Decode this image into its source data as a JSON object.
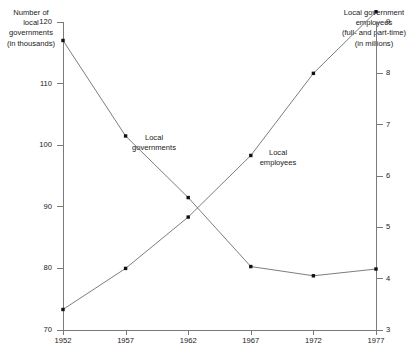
{
  "chart_data": {
    "type": "line",
    "title": "",
    "subtitle": "",
    "xlabel": "",
    "ylabel": "Number of local governments (in thousands)",
    "y2label": "Local government employees (full- and part-time) (in millions)",
    "categories": [
      "1952",
      "1957",
      "1962",
      "1967",
      "1972",
      "1977"
    ],
    "x": [
      1952,
      1957,
      1962,
      1967,
      1972,
      1977
    ],
    "grid": false,
    "legend": "inline-annotations",
    "ylim": [
      70,
      120
    ],
    "y2lim": [
      3,
      9
    ],
    "yticks": [
      "70",
      "80",
      "90",
      "100",
      "110",
      "120"
    ],
    "y2ticks": [
      "3",
      "4",
      "5",
      "6",
      "7",
      "8",
      "9"
    ],
    "series": [
      {
        "name": "Local governments",
        "axis": "left",
        "units": "thousands",
        "values": [
          117.0,
          101.5,
          91.5,
          80.3,
          78.8,
          79.9
        ]
      },
      {
        "name": "Local employees",
        "axis": "right",
        "units": "millions",
        "values": [
          3.4,
          4.2,
          5.2,
          6.4,
          8.0,
          9.2
        ]
      }
    ],
    "annotations": [
      {
        "text": "Local\ngovernments",
        "series": "Local governments"
      },
      {
        "text": "Local\nemployees",
        "series": "Local employees"
      }
    ]
  },
  "axes": {
    "left_caption": "Number of\nlocal\ngovernments\n(in thousands)",
    "right_caption": "Local government\nemployees\n(full- and part-time)\n(in millions)"
  },
  "labels": {
    "governments": "Local\ngovernments",
    "employees": "Local\nemployees"
  },
  "colors": {
    "line": "#6e6e6e",
    "marker": "#111111",
    "axis": "#7a7a7a",
    "text": "#1a1a1a",
    "background": "#ffffff"
  }
}
